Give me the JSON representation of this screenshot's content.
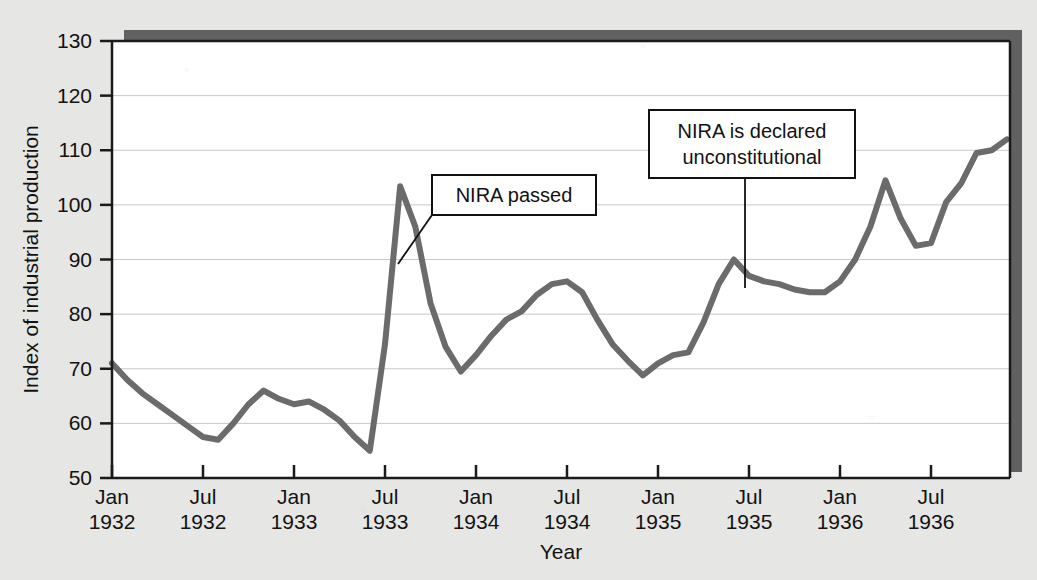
{
  "chart_data": {
    "type": "line",
    "title": "",
    "xlabel": "Year",
    "ylabel": "Index of industrial production",
    "ylim": [
      50,
      130
    ],
    "yticks": [
      50,
      60,
      70,
      80,
      90,
      100,
      110,
      120,
      130
    ],
    "grid": true,
    "grid_axis": "y",
    "legend": "none",
    "x_tick_labels": [
      {
        "month": "Jan",
        "year": "1932"
      },
      {
        "month": "Jul",
        "year": "1932"
      },
      {
        "month": "Jan",
        "year": "1933"
      },
      {
        "month": "Jul",
        "year": "1933"
      },
      {
        "month": "Jan",
        "year": "1934"
      },
      {
        "month": "Jul",
        "year": "1934"
      },
      {
        "month": "Jan",
        "year": "1935"
      },
      {
        "month": "Jul",
        "year": "1935"
      },
      {
        "month": "Jan",
        "year": "1936"
      },
      {
        "month": "Jul",
        "year": "1936"
      }
    ],
    "x": [
      "Jan 1932",
      "Feb 1932",
      "Mar 1932",
      "Apr 1932",
      "May 1932",
      "Jun 1932",
      "Jul 1932",
      "Aug 1932",
      "Sep 1932",
      "Oct 1932",
      "Nov 1932",
      "Dec 1932",
      "Jan 1933",
      "Feb 1933",
      "Mar 1933",
      "Apr 1933",
      "May 1933",
      "Jun 1933",
      "Jul 1933",
      "Aug 1933",
      "Sep 1933",
      "Oct 1933",
      "Nov 1933",
      "Dec 1933",
      "Jan 1934",
      "Feb 1934",
      "Mar 1934",
      "Apr 1934",
      "May 1934",
      "Jun 1934",
      "Jul 1934",
      "Aug 1934",
      "Sep 1934",
      "Oct 1934",
      "Nov 1934",
      "Dec 1934",
      "Jan 1935",
      "Feb 1935",
      "Mar 1935",
      "Apr 1935",
      "May 1935",
      "Jun 1935",
      "Jul 1935",
      "Aug 1935",
      "Sep 1935",
      "Oct 1935",
      "Nov 1935",
      "Dec 1935",
      "Jan 1936",
      "Feb 1936",
      "Mar 1936",
      "Apr 1936",
      "May 1936",
      "Jun 1936",
      "Jul 1936",
      "Aug 1936",
      "Sep 1936",
      "Oct 1936",
      "Nov 1936",
      "Dec 1936"
    ],
    "values": [
      71.0,
      68.0,
      65.5,
      63.5,
      61.5,
      59.5,
      57.5,
      57.0,
      60.0,
      63.5,
      66.0,
      64.5,
      63.5,
      64.0,
      62.5,
      60.5,
      57.5,
      55.0,
      74.5,
      103.4,
      96.0,
      82.0,
      74.0,
      69.5,
      72.5,
      76.0,
      79.0,
      80.5,
      83.5,
      85.5,
      86.0,
      84.0,
      79.0,
      74.5,
      71.5,
      68.8,
      71.0,
      72.5,
      73.0,
      78.5,
      85.5,
      90.0,
      87.0,
      86.0,
      85.5,
      84.5,
      84.0,
      84.0,
      86.0,
      90.0,
      96.0,
      104.5,
      97.5,
      92.5,
      93.0,
      100.5,
      104.0,
      109.5,
      110.0,
      112.0
    ],
    "series_name": "Index of industrial production",
    "line_color": "#6b6b6b",
    "line_width": 6,
    "plot_bg": "#ffffff",
    "figure_bg": "#e6e6e4",
    "axis_color": "#1a1a1a",
    "grid_color": "#c9c9c9",
    "shadow_color": "#5a5a5a"
  },
  "annotations": [
    {
      "id": "nira-passed",
      "text_lines": [
        "NIRA passed"
      ],
      "box": {
        "x": 432,
        "y": 175,
        "width": 164,
        "height": 40
      },
      "leader": {
        "from_x": 432,
        "from_y": 215,
        "to_x": 398,
        "to_y": 264
      },
      "target_x_label": "Jun 1933",
      "target_value": 91
    },
    {
      "id": "nira-unconstitutional",
      "text_lines": [
        "NIRA is declared",
        "unconstitutional"
      ],
      "box": {
        "x": 649,
        "y": 110,
        "width": 206,
        "height": 68
      },
      "leader": {
        "from_x": 745,
        "from_y": 178,
        "to_x": 745,
        "to_y": 288
      },
      "target_x_label": "Jul 1935",
      "target_value": 87
    }
  ],
  "plot_geometry": {
    "left": 112,
    "right": 1010,
    "top": 41,
    "bottom": 478,
    "x_tick_step_px": 91,
    "x_first_tick_px": 112
  }
}
